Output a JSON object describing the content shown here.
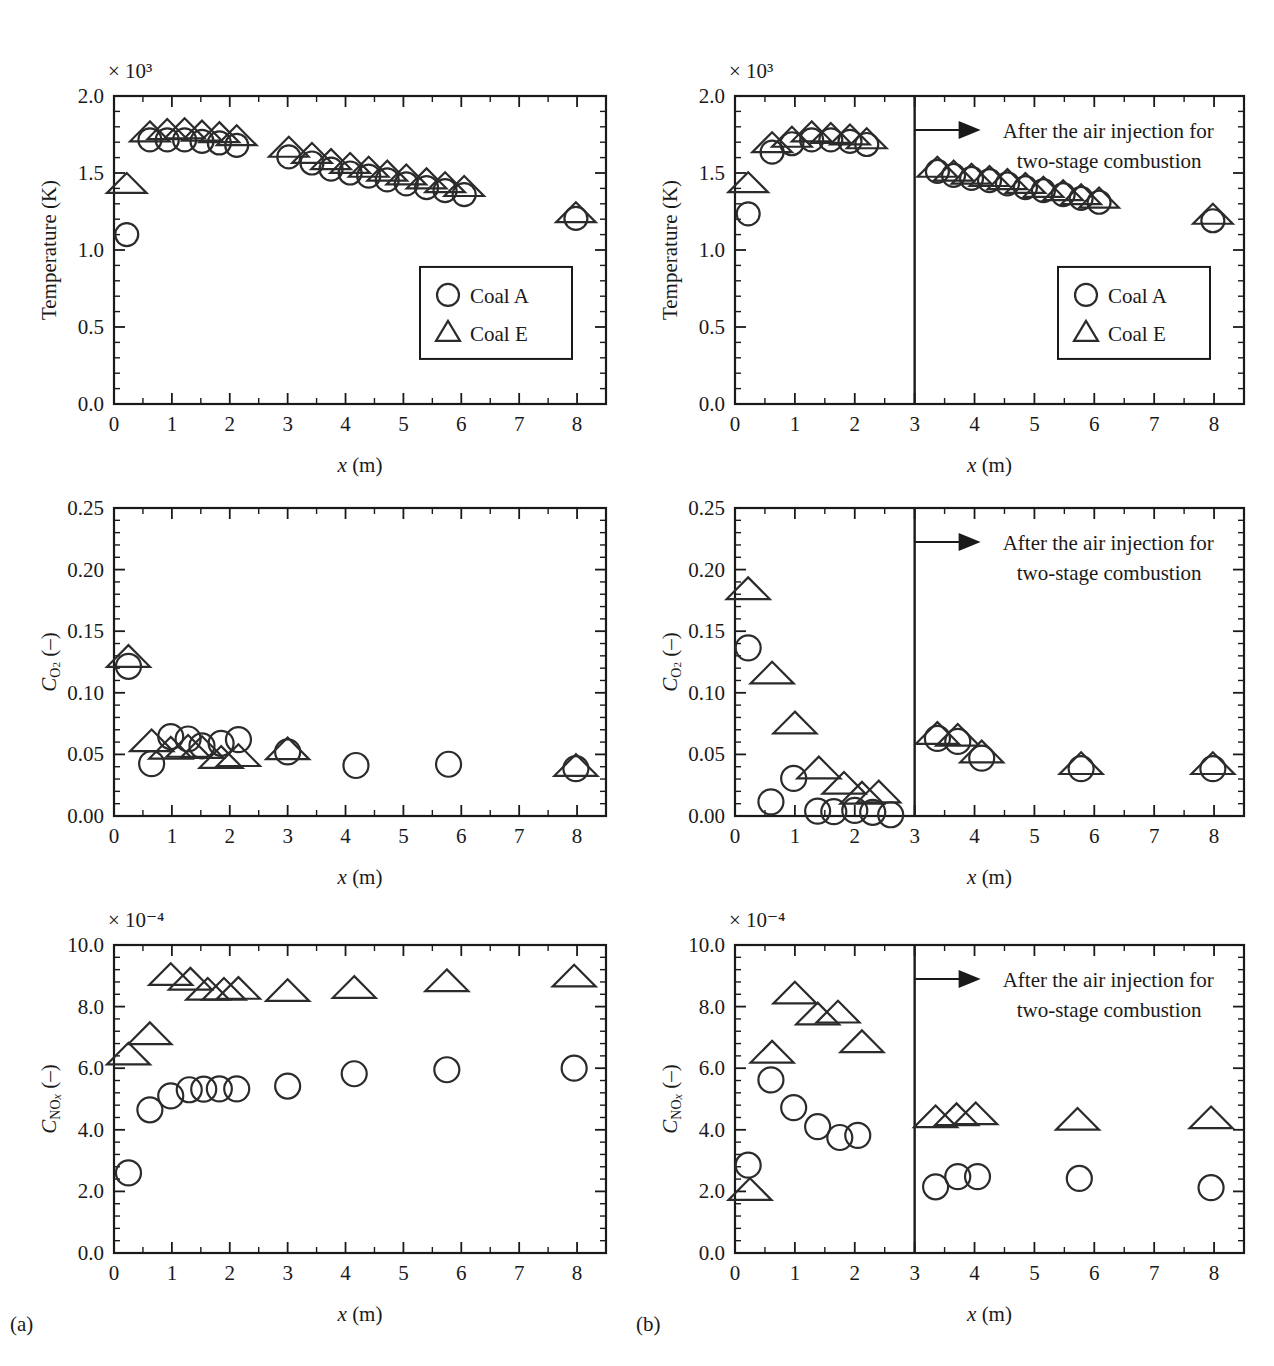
{
  "figure": {
    "sub_a": "(a)",
    "sub_b": "(b)",
    "annotation_line1": "After the air injection for",
    "annotation_line2": "two-stage combustion",
    "legend": {
      "coal_a": "Coal A",
      "coal_e": "Coal E",
      "marker_a": "circle",
      "marker_e": "triangle"
    },
    "xlabel": "x (m)",
    "xticks": [
      "0",
      "1",
      "2",
      "3",
      "4",
      "5",
      "6",
      "7",
      "8"
    ],
    "color_ink": "#1a1a1a"
  },
  "chart_data": [
    {
      "id": "panel-a-temperature",
      "type": "scatter",
      "title": "",
      "xlabel": "x (m)",
      "ylabel": "Temperature (K)",
      "exponent_label": "× 10³",
      "yexp": 3,
      "xlim": [
        0,
        8.5
      ],
      "ylim": [
        0.0,
        2.0
      ],
      "xticks": [
        0,
        1,
        2,
        3,
        4,
        5,
        6,
        7,
        8
      ],
      "yticks": [
        "0.0",
        "0.5",
        "1.0",
        "1.5",
        "2.0"
      ],
      "ytickvals": [
        0.0,
        0.5,
        1.0,
        1.5,
        2.0
      ],
      "grid": false,
      "legend_position": "lower-right",
      "series": [
        {
          "name": "Coal A",
          "marker": "circle",
          "x": [
            0.22,
            0.62,
            0.92,
            1.22,
            1.52,
            1.82,
            2.12,
            3.02,
            3.42,
            3.75,
            4.08,
            4.4,
            4.72,
            5.05,
            5.4,
            5.72,
            6.05
          ],
          "y": [
            1.1,
            1.715,
            1.715,
            1.715,
            1.705,
            1.695,
            1.68,
            1.605,
            1.565,
            1.525,
            1.5,
            1.48,
            1.455,
            1.43,
            1.405,
            1.385,
            1.36
          ]
        },
        {
          "name": "Coal E",
          "marker": "triangle",
          "x": [
            0.22,
            0.62,
            0.92,
            1.22,
            1.52,
            1.82,
            2.12,
            3.02,
            3.42,
            3.75,
            4.08,
            4.4,
            4.72,
            5.05,
            5.4,
            5.72,
            6.05
          ],
          "y": [
            1.425,
            1.76,
            1.775,
            1.78,
            1.765,
            1.755,
            1.735,
            1.66,
            1.62,
            1.58,
            1.555,
            1.53,
            1.505,
            1.48,
            1.455,
            1.43,
            1.405
          ]
        },
        {
          "name": "Coal A outlet",
          "marker": "circle",
          "x": [
            7.98
          ],
          "y": [
            1.205
          ]
        },
        {
          "name": "Coal E outlet",
          "marker": "triangle",
          "x": [
            7.98
          ],
          "y": [
            1.235
          ]
        }
      ]
    },
    {
      "id": "panel-b-temperature",
      "type": "scatter",
      "title": "",
      "xlabel": "x (m)",
      "ylabel": "Temperature (K)",
      "exponent_label": "× 10³",
      "yexp": 3,
      "xlim": [
        0,
        8.5
      ],
      "ylim": [
        0.0,
        2.0
      ],
      "xticks": [
        0,
        1,
        2,
        3,
        4,
        5,
        6,
        7,
        8
      ],
      "yticks": [
        "0.0",
        "0.5",
        "1.0",
        "1.5",
        "2.0"
      ],
      "ytickvals": [
        0.0,
        0.5,
        1.0,
        1.5,
        2.0
      ],
      "grid": false,
      "legend_position": "lower-right",
      "vline_x": 3.0,
      "annotation": "After the air injection for two-stage combustion",
      "series": [
        {
          "name": "Coal A",
          "marker": "circle",
          "x": [
            0.22,
            0.62,
            0.95,
            1.28,
            1.6,
            1.92,
            2.2,
            3.38,
            3.65,
            3.95,
            4.25,
            4.55,
            4.85,
            5.15,
            5.48,
            5.78,
            6.08
          ],
          "y": [
            1.235,
            1.635,
            1.69,
            1.715,
            1.715,
            1.705,
            1.685,
            1.51,
            1.485,
            1.465,
            1.45,
            1.43,
            1.405,
            1.385,
            1.36,
            1.335,
            1.31
          ]
        },
        {
          "name": "Coal E",
          "marker": "triangle",
          "x": [
            0.22,
            0.62,
            0.95,
            1.28,
            1.6,
            1.92,
            2.2,
            3.38,
            3.65,
            3.95,
            4.25,
            4.55,
            4.85,
            5.15,
            5.48,
            5.78,
            6.08
          ],
          "y": [
            1.43,
            1.69,
            1.725,
            1.76,
            1.75,
            1.74,
            1.715,
            1.53,
            1.505,
            1.485,
            1.47,
            1.45,
            1.425,
            1.4,
            1.378,
            1.352,
            1.33
          ]
        },
        {
          "name": "Coal A outlet",
          "marker": "circle",
          "x": [
            7.98
          ],
          "y": [
            1.19
          ]
        },
        {
          "name": "Coal E outlet",
          "marker": "triangle",
          "x": [
            7.98
          ],
          "y": [
            1.225
          ]
        }
      ]
    },
    {
      "id": "panel-a-co2",
      "type": "scatter",
      "title": "",
      "xlabel": "x (m)",
      "ylabel": "C_O2 (–)",
      "exponent_label": "",
      "xlim": [
        0,
        8.5
      ],
      "ylim": [
        0.0,
        0.25
      ],
      "xticks": [
        0,
        1,
        2,
        3,
        4,
        5,
        6,
        7,
        8
      ],
      "yticks": [
        "0.00",
        "0.05",
        "0.10",
        "0.15",
        "0.20",
        "0.25"
      ],
      "ytickvals": [
        0.0,
        0.05,
        0.1,
        0.15,
        0.2,
        0.25
      ],
      "grid": false,
      "series": [
        {
          "name": "Coal A",
          "marker": "circle",
          "x": [
            0.25,
            0.65,
            0.98,
            1.28,
            1.52,
            1.85,
            2.15,
            3.0,
            4.18,
            5.78,
            7.98
          ],
          "y": [
            0.1215,
            0.0425,
            0.0645,
            0.0625,
            0.057,
            0.059,
            0.062,
            0.052,
            0.041,
            0.042,
            0.0385
          ]
        },
        {
          "name": "Coal E",
          "marker": "triangle",
          "x": [
            0.25,
            0.65,
            0.98,
            1.28,
            1.52,
            1.85,
            2.15,
            3.0,
            7.98
          ],
          "y": [
            0.1285,
            0.06,
            0.054,
            0.0555,
            0.0545,
            0.0465,
            0.048,
            0.0535,
            0.04
          ]
        }
      ]
    },
    {
      "id": "panel-b-co2",
      "type": "scatter",
      "title": "",
      "xlabel": "x (m)",
      "ylabel": "C_O2 (–)",
      "exponent_label": "",
      "xlim": [
        0,
        8.5
      ],
      "ylim": [
        0.0,
        0.25
      ],
      "xticks": [
        0,
        1,
        2,
        3,
        4,
        5,
        6,
        7,
        8
      ],
      "yticks": [
        "0.00",
        "0.05",
        "0.10",
        "0.15",
        "0.20",
        "0.25"
      ],
      "ytickvals": [
        0.0,
        0.05,
        0.1,
        0.15,
        0.2,
        0.25
      ],
      "grid": false,
      "vline_x": 3.0,
      "annotation": "After the air injection for two-stage combustion",
      "series": [
        {
          "name": "Coal A",
          "marker": "circle",
          "x": [
            0.22,
            0.6,
            0.98,
            1.38,
            1.65,
            2.0,
            2.3,
            2.6,
            3.38,
            3.72,
            4.12,
            5.78,
            7.98
          ],
          "y": [
            0.1365,
            0.0115,
            0.0305,
            0.004,
            0.0035,
            0.0045,
            0.003,
            0.001,
            0.063,
            0.0605,
            0.047,
            0.0385,
            0.0385
          ]
        },
        {
          "name": "Coal E",
          "marker": "triangle",
          "x": [
            0.22,
            0.62,
            1.0,
            1.4,
            1.82,
            2.12,
            2.4,
            3.38,
            3.72,
            4.12,
            5.78,
            7.98
          ],
          "y": [
            0.1835,
            0.115,
            0.0745,
            0.038,
            0.0255,
            0.0175,
            0.0185,
            0.066,
            0.0645,
            0.051,
            0.0415,
            0.0415
          ]
        }
      ]
    },
    {
      "id": "panel-a-nox",
      "type": "scatter",
      "title": "",
      "xlabel": "x (m)",
      "ylabel": "C_NOx (–)",
      "exponent_label": "× 10⁻⁴",
      "yexp": -4,
      "xlim": [
        0,
        8.5
      ],
      "ylim": [
        0.0,
        10.0
      ],
      "xticks": [
        0,
        1,
        2,
        3,
        4,
        5,
        6,
        7,
        8
      ],
      "yticks": [
        "0.0",
        "2.0",
        "4.0",
        "6.0",
        "8.0",
        "10.0"
      ],
      "ytickvals": [
        0.0,
        2.0,
        4.0,
        6.0,
        8.0,
        10.0
      ],
      "grid": false,
      "series": [
        {
          "name": "Coal A",
          "marker": "circle",
          "x": [
            0.25,
            0.62,
            0.98,
            1.3,
            1.55,
            1.82,
            2.12,
            3.0,
            4.15,
            5.75,
            7.95
          ],
          "y": [
            2.6,
            4.65,
            5.1,
            5.3,
            5.32,
            5.33,
            5.33,
            5.42,
            5.82,
            5.95,
            6.0
          ]
        },
        {
          "name": "Coal E",
          "marker": "triangle",
          "x": [
            0.25,
            0.62,
            0.98,
            1.32,
            1.62,
            1.9,
            2.15,
            3.0,
            4.15,
            5.75,
            7.95
          ],
          "y": [
            6.42,
            7.08,
            9.0,
            8.85,
            8.52,
            8.52,
            8.55,
            8.48,
            8.58,
            8.8,
            8.95
          ]
        }
      ]
    },
    {
      "id": "panel-b-nox",
      "type": "scatter",
      "title": "",
      "xlabel": "x (m)",
      "ylabel": "C_NOx (–)",
      "exponent_label": "× 10⁻⁴",
      "yexp": -4,
      "xlim": [
        0,
        8.5
      ],
      "ylim": [
        0.0,
        10.0
      ],
      "xticks": [
        0,
        1,
        2,
        3,
        4,
        5,
        6,
        7,
        8
      ],
      "yticks": [
        "0.0",
        "2.0",
        "4.0",
        "6.0",
        "8.0",
        "10.0"
      ],
      "ytickvals": [
        0.0,
        2.0,
        4.0,
        6.0,
        8.0,
        10.0
      ],
      "grid": false,
      "vline_x": 3.0,
      "annotation": "After the air injection for two-stage combustion",
      "series": [
        {
          "name": "Coal A",
          "marker": "circle",
          "x": [
            0.22,
            0.6,
            0.98,
            1.38,
            1.75,
            2.05,
            3.35,
            3.72,
            4.05,
            5.75,
            7.95
          ],
          "y": [
            2.85,
            5.62,
            4.72,
            4.1,
            3.75,
            3.82,
            2.15,
            2.48,
            2.48,
            2.42,
            2.12
          ]
        },
        {
          "name": "Coal E",
          "marker": "triangle",
          "x": [
            0.25,
            0.62,
            1.0,
            1.38,
            1.72,
            2.12,
            3.35,
            3.7,
            4.02,
            5.72,
            7.95
          ],
          "y": [
            2.02,
            6.48,
            8.4,
            7.72,
            7.78,
            6.82,
            4.38,
            4.45,
            4.48,
            4.3,
            4.35
          ]
        }
      ]
    }
  ]
}
